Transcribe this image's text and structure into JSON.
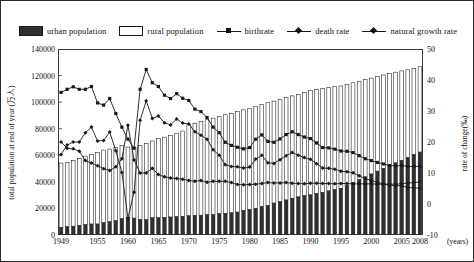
{
  "legend": {
    "items": [
      {
        "label": "urban population",
        "marker": "fill-swatch",
        "name": "legend-urban-population"
      },
      {
        "label": "rural population",
        "marker": "open-swatch",
        "name": "legend-rural-population"
      },
      {
        "label": "birthrate",
        "marker": "line-square",
        "name": "legend-birthrate"
      },
      {
        "label": "death rate",
        "marker": "line-diamond",
        "name": "legend-death-rate"
      },
      {
        "label": "natural growth rate",
        "marker": "line-diamond-2",
        "name": "legend-natural-growth-rate"
      }
    ]
  },
  "axes": {
    "y_left_title": "total population at end of year (万人)",
    "y_right_title": "rate of change(‰)",
    "x_unit": "(years)",
    "y_left_ticks": [
      "0",
      "20000",
      "40000",
      "60000",
      "80000",
      "100000",
      "120000",
      "140000"
    ],
    "y_right_ticks": [
      "-10",
      "0",
      "10",
      "20",
      "30",
      "40",
      "50"
    ],
    "x_ticks": [
      "1949",
      "1955",
      "1960",
      "1965",
      "1970",
      "1975",
      "1980",
      "1985",
      "1990",
      "1995",
      "2000",
      "2005",
      "2008"
    ]
  },
  "colors": {
    "urban": "#2f2f2f",
    "rural": "#ffffff",
    "rural_stroke": "#1a1a1a",
    "line": "#1a1a1a",
    "frame": "#3a3a3a",
    "text": "#111111"
  },
  "chart_data": {
    "type": "bar",
    "title": "",
    "xlabel": "(years)",
    "ylabel": "total population at end of year (万人)",
    "y2label": "rate of change(‰)",
    "ylim": [
      0,
      140000
    ],
    "y2lim": [
      -10,
      50
    ],
    "grid": false,
    "legend_position": "top",
    "stacked": true,
    "x": [
      1949,
      1950,
      1951,
      1952,
      1953,
      1954,
      1955,
      1956,
      1957,
      1958,
      1959,
      1960,
      1961,
      1962,
      1963,
      1964,
      1965,
      1966,
      1967,
      1968,
      1969,
      1970,
      1971,
      1972,
      1973,
      1974,
      1975,
      1976,
      1977,
      1978,
      1979,
      1980,
      1981,
      1982,
      1983,
      1984,
      1985,
      1986,
      1987,
      1988,
      1989,
      1990,
      1991,
      1992,
      1993,
      1994,
      1995,
      1996,
      1997,
      1998,
      1999,
      2000,
      2001,
      2002,
      2003,
      2004,
      2005,
      2006,
      2007,
      2008
    ],
    "series": [
      {
        "name": "urban population",
        "type": "bar",
        "axis": "left",
        "values": [
          5765,
          6169,
          6632,
          7163,
          7826,
          8249,
          8285,
          9185,
          9949,
          10721,
          12371,
          13073,
          12707,
          11659,
          11646,
          12950,
          13045,
          13313,
          13548,
          13838,
          14117,
          14424,
          14711,
          14935,
          15345,
          15595,
          16030,
          16341,
          16669,
          17245,
          18495,
          19140,
          20171,
          21480,
          22274,
          24017,
          25094,
          26366,
          27674,
          28661,
          29540,
          30195,
          31203,
          32175,
          33173,
          34169,
          35174,
          37304,
          39449,
          41608,
          43748,
          45906,
          48064,
          50212,
          52376,
          54283,
          56212,
          58288,
          60633,
          62403
        ],
        "unit": "万人"
      },
      {
        "name": "rural population",
        "type": "bar",
        "axis": "left",
        "values": [
          48402,
          48402,
          49452,
          50319,
          51534,
          52269,
          53800,
          54740,
          54704,
          55273,
          54836,
          53134,
          53152,
          55636,
          57306,
          57821,
          59493,
          60346,
          61501,
          62780,
          64145,
          68568,
          69438,
          70375,
          71384,
          72382,
          73244,
          74167,
          74963,
          75808,
          75705,
          76051,
          76440,
          76910,
          77283,
          76752,
          76743,
          77005,
          77034,
          77173,
          77677,
          78670,
          78407,
          78216,
          77924,
          77517,
          76985,
          76128,
          75159,
          74167,
          73217,
          72200,
          71178,
          70236,
          69268,
          68269,
          67296,
          66094,
          64855,
          64222
        ],
        "unit": "万人"
      },
      {
        "name": "birthrate",
        "type": "line",
        "axis": "right",
        "values": [
          36.0,
          37.0,
          37.8,
          37.0,
          37.0,
          37.9,
          32.6,
          31.9,
          34.0,
          29.2,
          24.8,
          20.9,
          18.0,
          37.0,
          43.4,
          39.1,
          37.9,
          35.1,
          34.0,
          35.6,
          34.1,
          33.4,
          30.6,
          29.8,
          27.9,
          24.8,
          23.0,
          19.9,
          18.9,
          18.3,
          17.8,
          18.2,
          20.9,
          22.3,
          20.2,
          19.9,
          21.0,
          22.4,
          23.3,
          22.4,
          21.6,
          21.1,
          19.7,
          18.2,
          18.1,
          17.7,
          17.1,
          17.0,
          16.6,
          15.6,
          14.6,
          14.0,
          13.4,
          12.9,
          12.4,
          12.3,
          12.4,
          12.1,
          12.1,
          12.1
        ],
        "unit": "‰"
      },
      {
        "name": "death rate",
        "type": "line",
        "axis": "right",
        "values": [
          20.0,
          18.0,
          17.8,
          17.0,
          14.0,
          13.2,
          12.3,
          11.4,
          10.8,
          12.0,
          14.6,
          25.4,
          14.2,
          10.0,
          10.0,
          11.5,
          9.5,
          8.8,
          8.4,
          8.2,
          8.0,
          7.6,
          7.3,
          7.6,
          7.0,
          7.3,
          7.3,
          7.3,
          6.9,
          6.3,
          6.2,
          6.3,
          6.4,
          6.6,
          6.9,
          6.8,
          6.8,
          6.9,
          6.7,
          6.6,
          6.5,
          6.7,
          6.7,
          6.6,
          6.6,
          6.5,
          6.6,
          6.6,
          6.5,
          6.5,
          6.5,
          6.5,
          6.4,
          6.4,
          6.4,
          6.4,
          6.5,
          6.8,
          6.9,
          7.1
        ],
        "unit": "‰"
      },
      {
        "name": "natural growth rate",
        "type": "line",
        "axis": "right",
        "values": [
          16.0,
          19.0,
          20.0,
          20.0,
          23.0,
          24.8,
          20.3,
          20.5,
          23.2,
          17.2,
          10.2,
          -4.6,
          3.8,
          27.0,
          33.3,
          27.6,
          28.4,
          26.2,
          25.5,
          27.4,
          26.1,
          25.8,
          23.3,
          22.2,
          20.9,
          17.5,
          15.7,
          12.7,
          12.1,
          12.0,
          11.6,
          11.9,
          14.5,
          15.7,
          13.3,
          13.1,
          14.3,
          15.6,
          16.6,
          15.7,
          15.0,
          14.4,
          13.0,
          11.6,
          11.5,
          11.2,
          10.6,
          10.4,
          10.1,
          9.1,
          8.2,
          7.6,
          7.0,
          6.5,
          6.0,
          5.9,
          5.9,
          5.3,
          5.2,
          5.1
        ],
        "unit": "‰"
      }
    ]
  }
}
